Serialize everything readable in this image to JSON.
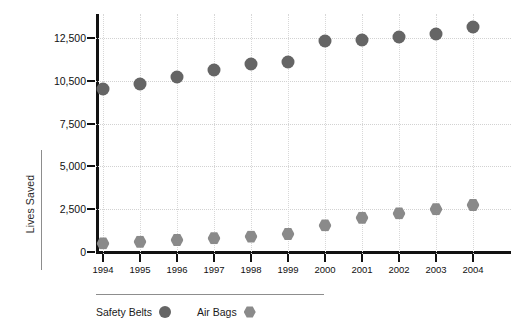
{
  "chart_data": {
    "type": "scatter",
    "title": "",
    "xlabel": "",
    "ylabel": "Lives Saved",
    "categories": [
      "1994",
      "1995",
      "1996",
      "1997",
      "1998",
      "1999",
      "2000",
      "2001",
      "2002",
      "2003",
      "2004"
    ],
    "x_tick_labels": [
      "1994",
      "1995",
      "1996",
      "1997",
      "1998",
      "1999",
      "2000",
      "2001",
      "2002",
      "2003",
      "2004"
    ],
    "y_tick_labels": [
      "0",
      "2,500",
      "5,000",
      "7,500",
      "10,500",
      "12,500"
    ],
    "y_tick_values": [
      0,
      2500,
      5000,
      7500,
      10500,
      12500
    ],
    "ylim": [
      0,
      13200
    ],
    "grid": true,
    "legend_position": "bottom-left",
    "series": [
      {
        "name": "Safety Belts",
        "marker": "circle",
        "color": "#656565",
        "values": [
          9900,
          10300,
          10700,
          11000,
          11300,
          11400,
          12350,
          12400,
          12550,
          12700,
          13000
        ]
      },
      {
        "name": "Air Bags",
        "marker": "hexagon",
        "color": "#8a8a8a",
        "values": [
          500,
          600,
          700,
          800,
          900,
          1050,
          1550,
          2000,
          2250,
          2500,
          2750
        ]
      }
    ]
  },
  "legend": {
    "items": [
      {
        "label": "Safety Belts",
        "marker": "circle",
        "color": "#656565"
      },
      {
        "label": "Air Bags",
        "marker": "hexagon",
        "color": "#8a8a8a"
      }
    ]
  },
  "axis": {
    "y_title": "Lives Saved"
  },
  "colors": {
    "axis": "#111111",
    "grid": "#d2d2d2",
    "series_primary": "#656565",
    "series_secondary": "#8a8a8a",
    "background": "#ffffff"
  }
}
